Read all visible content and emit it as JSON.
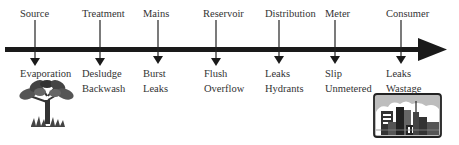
{
  "diagram": {
    "stages": [
      {
        "name": "Source",
        "losses": [
          "Evaporation",
          ""
        ]
      },
      {
        "name": "Treatment",
        "losses": [
          "Desludge",
          "Backwash"
        ]
      },
      {
        "name": "Mains",
        "losses": [
          "Burst",
          "Leaks"
        ]
      },
      {
        "name": "Reservoir",
        "losses": [
          "Flush",
          "Overflow"
        ]
      },
      {
        "name": "Distribution",
        "losses": [
          "Leaks",
          "Hydrants"
        ]
      },
      {
        "name": "Meter",
        "losses": [
          "Slip",
          "Unmetered"
        ]
      },
      {
        "name": "Consumer",
        "losses": [
          "Leaks",
          "Wastage"
        ]
      }
    ],
    "icons": {
      "source": "tree-icon",
      "consumer": "city-skyline-icon"
    },
    "colors": {
      "line": "#1a1a1a",
      "text": "#333333"
    }
  }
}
